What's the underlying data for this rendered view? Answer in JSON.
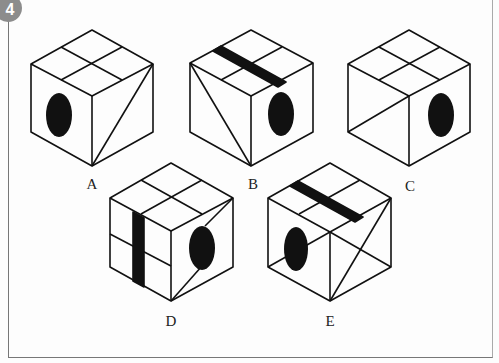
{
  "badge": {
    "number": "4",
    "color": "#8c8c8c"
  },
  "options": [
    {
      "label": "A",
      "x": 92,
      "y": 176
    },
    {
      "label": "B",
      "x": 253,
      "y": 176
    },
    {
      "label": "C",
      "x": 410,
      "y": 178
    },
    {
      "label": "D",
      "x": 171,
      "y": 313
    },
    {
      "label": "E",
      "x": 330,
      "y": 313
    }
  ]
}
